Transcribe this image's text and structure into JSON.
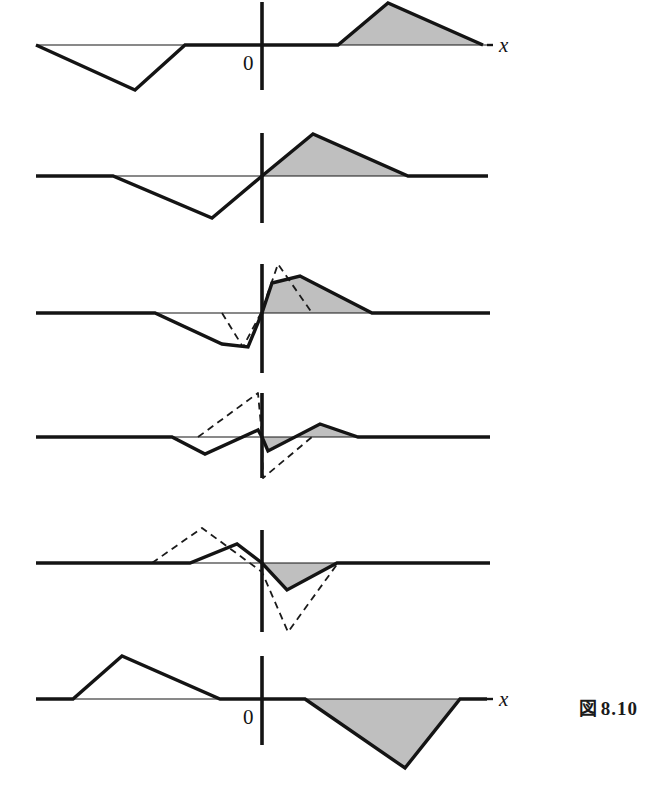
{
  "figure": {
    "caption_kanji": "図",
    "caption_number": "8.10",
    "background_color": "#ffffff",
    "curve_color": "#141414",
    "axis_color": "#141414",
    "shade_color": "#bfbfbf",
    "dashed_color": "#1a1a1a"
  },
  "labels": {
    "x_axis": "x",
    "origin": "0"
  },
  "chart_data": {
    "type": "line",
    "xlabel": "x",
    "ylabel": "",
    "grid": false,
    "legend": "none",
    "panels": [
      {
        "index": 1,
        "name": "panel-1",
        "axis_y": 45,
        "axis_x_start": 36,
        "axis_x_end": 487,
        "vertical_axis_x": 262,
        "vertical_axis_top": 2,
        "vertical_axis_bottom": 90,
        "has_x_label": true,
        "has_zero_label": true,
        "has_dashed": false,
        "solid_points": [
          [
            36,
            45
          ],
          [
            135,
            90
          ],
          [
            185,
            45
          ],
          [
            338,
            45
          ],
          [
            388,
            3
          ],
          [
            483,
            45
          ]
        ],
        "shaded_polygon": [
          [
            338,
            45
          ],
          [
            388,
            3
          ],
          [
            483,
            45
          ]
        ],
        "shaded_sign": "positive"
      },
      {
        "index": 2,
        "name": "panel-2",
        "axis_y": 176,
        "axis_x_start": 36,
        "axis_x_end": 488,
        "vertical_axis_x": 262,
        "vertical_axis_top": 133,
        "vertical_axis_bottom": 223,
        "has_x_label": false,
        "has_zero_label": false,
        "has_dashed": false,
        "solid_points": [
          [
            36,
            176
          ],
          [
            113,
            176
          ],
          [
            212,
            218
          ],
          [
            262,
            176
          ],
          [
            313,
            134
          ],
          [
            408,
            176
          ],
          [
            488,
            176
          ]
        ],
        "shaded_polygon": [
          [
            262,
            176
          ],
          [
            313,
            134
          ],
          [
            408,
            176
          ]
        ],
        "shaded_sign": "positive"
      },
      {
        "index": 3,
        "name": "panel-3",
        "axis_y": 313,
        "axis_x_start": 36,
        "axis_x_end": 490,
        "vertical_axis_x": 262,
        "vertical_axis_top": 264,
        "vertical_axis_bottom": 373,
        "has_x_label": false,
        "has_zero_label": false,
        "has_dashed": true,
        "solid_points": [
          [
            36,
            313
          ],
          [
            155,
            313
          ],
          [
            222,
            344
          ],
          [
            248,
            347
          ],
          [
            262,
            313
          ],
          [
            272,
            283
          ],
          [
            300,
            276
          ],
          [
            372,
            313
          ],
          [
            490,
            313
          ]
        ],
        "dashed_points": [
          [
            222,
            313
          ],
          [
            243,
            347
          ],
          [
            261,
            313
          ],
          [
            278,
            264
          ],
          [
            312,
            313
          ]
        ],
        "shaded_polygon": [
          [
            262,
            313
          ],
          [
            272,
            283
          ],
          [
            300,
            276
          ],
          [
            372,
            313
          ]
        ],
        "shaded_sign": "positive"
      },
      {
        "index": 4,
        "name": "panel-4",
        "axis_y": 437,
        "axis_x_start": 36,
        "axis_x_end": 490,
        "vertical_axis_x": 262,
        "vertical_axis_top": 393,
        "vertical_axis_bottom": 478,
        "has_x_label": false,
        "has_zero_label": false,
        "has_dashed": true,
        "solid_points": [
          [
            36,
            437
          ],
          [
            172,
            437
          ],
          [
            205,
            454
          ],
          [
            258,
            430
          ],
          [
            262,
            437
          ],
          [
            268,
            451
          ],
          [
            320,
            424
          ],
          [
            358,
            437
          ],
          [
            490,
            437
          ]
        ],
        "dashed_points": [
          [
            198,
            437
          ],
          [
            258,
            393
          ],
          [
            262,
            437
          ],
          [
            263,
            478
          ],
          [
            312,
            437
          ]
        ],
        "shaded_polygon": [
          [
            262,
            437
          ],
          [
            268,
            451
          ],
          [
            320,
            424
          ],
          [
            358,
            437
          ]
        ],
        "shaded_sign": "mixed"
      },
      {
        "index": 5,
        "name": "panel-5",
        "axis_y": 563,
        "axis_x_start": 36,
        "axis_x_end": 490,
        "vertical_axis_x": 262,
        "vertical_axis_top": 530,
        "vertical_axis_bottom": 632,
        "has_x_label": false,
        "has_zero_label": false,
        "has_dashed": true,
        "solid_points": [
          [
            36,
            563
          ],
          [
            190,
            563
          ],
          [
            237,
            544
          ],
          [
            262,
            563
          ],
          [
            287,
            590
          ],
          [
            337,
            563
          ],
          [
            490,
            563
          ]
        ],
        "dashed_points": [
          [
            152,
            563
          ],
          [
            202,
            528
          ],
          [
            262,
            572
          ],
          [
            288,
            632
          ],
          [
            338,
            563
          ]
        ],
        "shaded_polygon": [
          [
            262,
            563
          ],
          [
            287,
            590
          ],
          [
            337,
            563
          ]
        ],
        "shaded_sign": "negative"
      },
      {
        "index": 6,
        "name": "panel-6",
        "axis_y": 699,
        "axis_x_start": 36,
        "axis_x_end": 487,
        "vertical_axis_x": 262,
        "vertical_axis_top": 656,
        "vertical_axis_bottom": 745,
        "has_x_label": true,
        "has_zero_label": true,
        "has_dashed": false,
        "solid_points": [
          [
            36,
            699
          ],
          [
            73,
            699
          ],
          [
            122,
            656
          ],
          [
            220,
            699
          ],
          [
            305,
            699
          ],
          [
            405,
            768
          ],
          [
            460,
            699
          ],
          [
            487,
            699
          ]
        ],
        "shaded_polygon": [
          [
            305,
            699
          ],
          [
            405,
            768
          ],
          [
            460,
            699
          ]
        ],
        "shaded_sign": "negative"
      }
    ]
  }
}
